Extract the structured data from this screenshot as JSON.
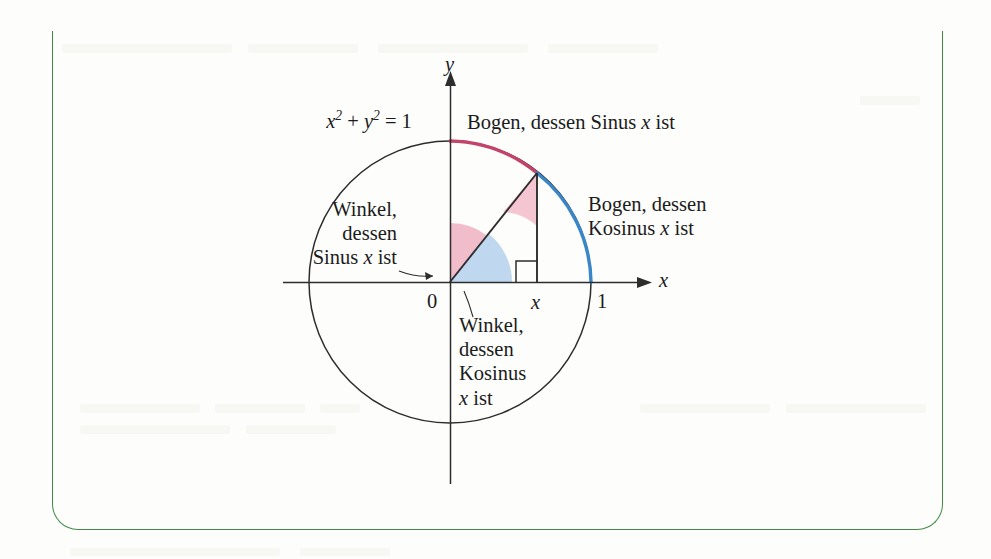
{
  "figure": {
    "frame_color": "#3f8b46",
    "axis_label_x": "x",
    "axis_label_y": "y",
    "origin_label": "0",
    "tick_one_label": "1",
    "tick_x_label": "x",
    "circle_equation": {
      "base1": "x",
      "exp1": "2",
      "plus": " + ",
      "base2": "y",
      "exp2": "2",
      "equals": " = 1"
    },
    "labels": {
      "arc_sine": "Bogen, dessen Sinus x ist",
      "arc_cosine_line1": "Bogen, dessen",
      "arc_cosine_line2": "Kosinus x ist",
      "angle_sine_line1": "Winkel,",
      "angle_sine_line2": "dessen",
      "angle_sine_line3": "Sinus x ist",
      "angle_cosine_line1": "Winkel,",
      "angle_cosine_line2": "dessen",
      "angle_cosine_line3": "Kosinus",
      "angle_cosine_line4": "x ist"
    },
    "colors": {
      "arc_sine_color": "#c4436a",
      "arc_cosine_color": "#3a86c8",
      "wedge_pink": "#f2b9c6",
      "wedge_blue": "#bcd6ee",
      "stroke_dark": "#2d2d2d"
    },
    "geometry": {
      "center_x": 450,
      "center_y": 282,
      "radius": 141,
      "point_on_circle_x": 537,
      "point_on_circle_y": 173,
      "angle_degrees": 51,
      "x_tick_value": 1
    }
  },
  "chart_data": {
    "type": "scatter",
    "xlabel": "x",
    "ylabel": "y",
    "xlim": [
      -1.35,
      1.35
    ],
    "ylim": [
      -1.35,
      1.35
    ],
    "grid": false,
    "legend_position": "none",
    "tick_labels_x": [
      "0",
      "x",
      "1"
    ],
    "tick_values_x": [
      0,
      0.617,
      1
    ],
    "curves": [
      {
        "name": "unit circle",
        "equation": "x^2 + y^2 = 1",
        "color": "#2d2d2d",
        "radius": 1
      },
      {
        "name": "Bogen, dessen Sinus x ist",
        "type": "arc",
        "color": "#c4436a",
        "start_angle_deg": 51,
        "end_angle_deg": 90,
        "note": "arc from point on circle up to (0,1)"
      },
      {
        "name": "Bogen, dessen Kosinus x ist",
        "type": "arc",
        "color": "#3a86c8",
        "start_angle_deg": 0,
        "end_angle_deg": 51,
        "note": "arc from (1,0) up to point on circle"
      }
    ],
    "wedges": [
      {
        "name": "Winkel, dessen Sinus x ist",
        "color": "#f2b9c6",
        "vertex": "origin",
        "start_angle_deg": 51,
        "end_angle_deg": 90
      },
      {
        "name": "Winkel, dessen Kosinus x ist",
        "color": "#bcd6ee",
        "vertex": "origin",
        "start_angle_deg": 0,
        "end_angle_deg": 51
      },
      {
        "name": "Winkel, dessen Sinus x ist (am Punkt)",
        "color": "#f2b9c6",
        "vertex": "point_on_circle",
        "note": "angle between hypotenuse and vertical leg"
      }
    ],
    "points": [
      {
        "label": "0",
        "x": 0,
        "y": 0
      },
      {
        "label": "1",
        "x": 1,
        "y": 0
      },
      {
        "label": "x",
        "x": 0.617,
        "y": 0
      },
      {
        "label": "point on circle",
        "x": 0.617,
        "y": 0.787
      }
    ],
    "annotations": [
      "x^2 + y^2 = 1",
      "Bogen, dessen Sinus x ist",
      "Bogen, dessen Kosinus x ist",
      "Winkel, dessen Sinus x ist",
      "Winkel, dessen Kosinus x ist"
    ]
  }
}
